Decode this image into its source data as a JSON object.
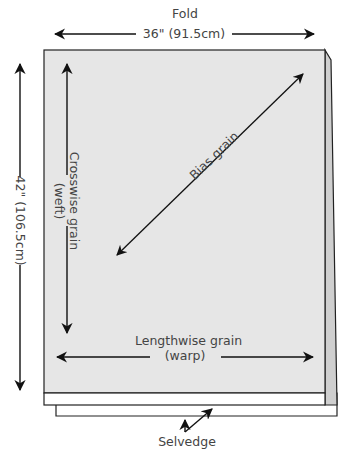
{
  "labels": {
    "fold": "Fold",
    "width": "36\" (91.5cm)",
    "length": "42\" (106.5cm)",
    "crosswise_line1": "Crosswise grain",
    "crosswise_line2": "(weft)",
    "bias": "Bias grain",
    "lengthwise_line1": "Lengthwise grain",
    "lengthwise_line2": "(warp)",
    "selvedge": "Selvedge"
  },
  "colors": {
    "fabric": "#e6e6e6",
    "fold_side": "#cfcfcf",
    "selvedge": "#ffffff",
    "outline": "#222222",
    "text": "#444444"
  }
}
